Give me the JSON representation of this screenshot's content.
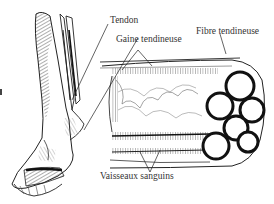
{
  "diagram": {
    "type": "anatomical-illustration",
    "labels": {
      "tendon": "Tendon",
      "sheath": "Gaine tendineuse",
      "fibre": "Fibre tendineuse",
      "vessels": "Vaisseaux sanguins"
    },
    "colors": {
      "ink": "#222222",
      "background": "#ffffff",
      "text": "#333333"
    }
  }
}
